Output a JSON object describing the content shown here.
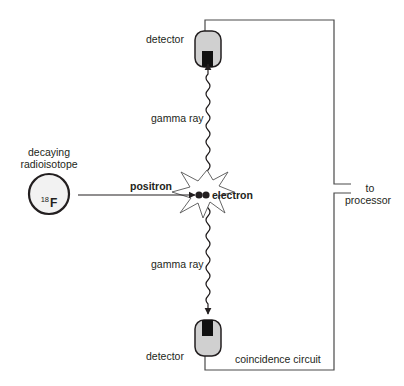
{
  "diagram": {
    "type": "PET coincidence detection schematic",
    "colors": {
      "line": "#3a3a3a",
      "detector_fill": "#d0d0d0",
      "crystal": "#111111",
      "isotope_fill": "#f2f2f2"
    },
    "labels": {
      "detector_top": "detector",
      "detector_bottom": "detector",
      "gamma_ray_top": "gamma ray",
      "gamma_ray_bottom": "gamma ray",
      "isotope_caption_line1": "decaying",
      "isotope_caption_line2": "radioisotope",
      "isotope_mass_number": "18",
      "isotope_symbol": "F",
      "positron": "positron",
      "electron": "electron",
      "to_processor_line1": "to",
      "to_processor_line2": "processor",
      "coincidence_circuit": "coincidence circuit"
    },
    "nodes": [
      {
        "id": "isotope",
        "label": "decaying radioisotope (18F)"
      },
      {
        "id": "annihilation",
        "label": "positron + electron annihilation"
      },
      {
        "id": "detector_top",
        "label": "detector"
      },
      {
        "id": "detector_bottom",
        "label": "detector"
      },
      {
        "id": "processor",
        "label": "to processor"
      }
    ],
    "edges": [
      {
        "from": "isotope",
        "to": "annihilation",
        "label": "positron"
      },
      {
        "from": "annihilation",
        "to": "detector_top",
        "label": "gamma ray"
      },
      {
        "from": "annihilation",
        "to": "detector_bottom",
        "label": "gamma ray"
      },
      {
        "from": "detector_top",
        "to": "processor",
        "label": "coincidence circuit"
      },
      {
        "from": "detector_bottom",
        "to": "processor",
        "label": "coincidence circuit"
      }
    ]
  }
}
